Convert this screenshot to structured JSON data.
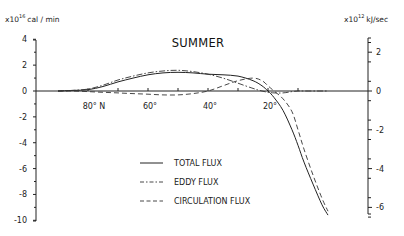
{
  "chart_data": {
    "type": "line",
    "title": "SUMMER",
    "xlabel": "Latitude",
    "ylabel_left": "x10^16 cal/min",
    "ylabel_right": "x10^12 kJ/sec",
    "left_axis": {
      "multiplier": "x10",
      "exponent": "16",
      "unit": "cal / min",
      "ticks": [
        "4",
        "2",
        "0",
        "-2",
        "-4",
        "-6",
        "-8",
        "-10"
      ],
      "ylim": [
        -10,
        4
      ]
    },
    "right_axis": {
      "multiplier": "x10",
      "exponent": "12",
      "unit": "kJ/sec",
      "ticks": [
        "2",
        "0",
        "-2",
        "-4",
        "-6"
      ],
      "ylim": [
        -6.5,
        2.8
      ]
    },
    "x_ticks": [
      "80° N",
      "60°",
      "40°",
      "20°"
    ],
    "x": [
      90,
      85,
      80,
      75,
      70,
      65,
      60,
      55,
      50,
      45,
      40,
      35,
      30,
      25,
      22,
      20,
      18,
      15,
      12,
      10,
      8,
      5,
      2,
      0
    ],
    "series": [
      {
        "name": "TOTAL FLUX",
        "style": "solid",
        "values": [
          0,
          0.05,
          0.1,
          0.35,
          0.7,
          1.0,
          1.25,
          1.4,
          1.45,
          1.4,
          1.3,
          1.25,
          1.15,
          0.8,
          0.4,
          0.0,
          -0.5,
          -1.5,
          -3.0,
          -4.2,
          -5.5,
          -7.2,
          -8.8,
          -9.6
        ]
      },
      {
        "name": "EDDY FLUX",
        "style": "dash-dot",
        "values": [
          0,
          0.05,
          0.15,
          0.45,
          0.85,
          1.15,
          1.4,
          1.55,
          1.6,
          1.5,
          1.3,
          1.0,
          0.6,
          0.2,
          0.0,
          -0.1,
          -0.15,
          -0.15,
          -0.05,
          0,
          0,
          0,
          0,
          0
        ]
      },
      {
        "name": "CIRCULATION FLUX",
        "style": "dashed",
        "values": [
          0,
          0,
          -0.05,
          -0.1,
          -0.15,
          -0.2,
          -0.25,
          -0.3,
          -0.3,
          -0.2,
          0.0,
          0.4,
          0.8,
          1.0,
          0.8,
          0.4,
          0.0,
          -0.6,
          -1.6,
          -3.0,
          -4.5,
          -6.5,
          -8.3,
          -9.3
        ]
      }
    ],
    "legend": {
      "position": "lower-center",
      "entries": [
        "TOTAL FLUX",
        "EDDY FLUX",
        "CIRCULATION FLUX"
      ]
    },
    "grid": false
  }
}
